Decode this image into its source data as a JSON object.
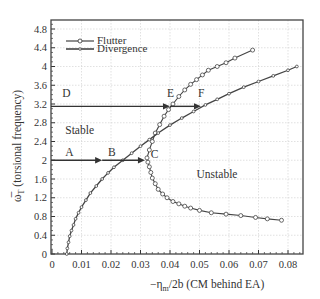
{
  "chart_data": {
    "type": "line",
    "title": "",
    "xlabel": "−ηm/2b (CM behind EA)",
    "ylabel": "ω̅T (torsional frequency)",
    "xlim": [
      0,
      0.085
    ],
    "ylim": [
      0,
      5.0
    ],
    "x_ticks": [
      "0",
      "0.01",
      "0.02",
      "0.03",
      "0.04",
      "0.05",
      "0.06",
      "0.07",
      "0.08"
    ],
    "y_ticks": [
      "0",
      "0.4",
      "0.8",
      "1.2",
      "1.6",
      "2",
      "2.4",
      "2.8",
      "3.2",
      "3.6",
      "4",
      "4.4",
      "4.8"
    ],
    "grid": true,
    "legend_position": "upper left",
    "series": [
      {
        "name": "Flutter",
        "marker": "open-circle",
        "x": [
          0.0778,
          0.073,
          0.069,
          0.064,
          0.059,
          0.054,
          0.05,
          0.047,
          0.045,
          0.043,
          0.041,
          0.039,
          0.0375,
          0.036,
          0.035,
          0.034,
          0.0335,
          0.033,
          0.0325,
          0.0322,
          0.033,
          0.034,
          0.035,
          0.0365,
          0.038,
          0.0395,
          0.041,
          0.043,
          0.045,
          0.047,
          0.049,
          0.051,
          0.053,
          0.056,
          0.059,
          0.062,
          0.068
        ],
        "y": [
          0.72,
          0.75,
          0.78,
          0.82,
          0.85,
          0.88,
          0.93,
          0.98,
          1.02,
          1.07,
          1.12,
          1.2,
          1.28,
          1.38,
          1.5,
          1.62,
          1.74,
          1.86,
          1.96,
          2.05,
          2.22,
          2.4,
          2.58,
          2.76,
          2.94,
          3.08,
          3.2,
          3.36,
          3.5,
          3.62,
          3.72,
          3.82,
          3.92,
          4.0,
          4.08,
          4.18,
          4.35
        ]
      },
      {
        "name": "Divergence",
        "marker": "small-circle",
        "x": [
          0.005,
          0.0052,
          0.0056,
          0.006,
          0.0066,
          0.0073,
          0.008,
          0.009,
          0.01,
          0.0115,
          0.013,
          0.015,
          0.017,
          0.019,
          0.021,
          0.024,
          0.027,
          0.03,
          0.033,
          0.036,
          0.04,
          0.044,
          0.048,
          0.052,
          0.056,
          0.06,
          0.065,
          0.07,
          0.075,
          0.08,
          0.083
        ],
        "y": [
          0.0,
          0.12,
          0.25,
          0.38,
          0.5,
          0.62,
          0.75,
          0.88,
          1.0,
          1.15,
          1.3,
          1.45,
          1.6,
          1.73,
          1.85,
          2.0,
          2.15,
          2.3,
          2.44,
          2.58,
          2.75,
          2.9,
          3.04,
          3.18,
          3.3,
          3.42,
          3.56,
          3.68,
          3.8,
          3.92,
          4.0
        ]
      }
    ],
    "annotations": [
      {
        "text": "A",
        "x": 0.0045,
        "y": 2.1
      },
      {
        "text": "B",
        "x": 0.019,
        "y": 2.1
      },
      {
        "text": "C",
        "x": 0.0335,
        "y": 2.05
      },
      {
        "text": "D",
        "x": 0.0035,
        "y": 3.35
      },
      {
        "text": "E",
        "x": 0.039,
        "y": 3.35
      },
      {
        "text": "F",
        "x": 0.0495,
        "y": 3.35
      },
      {
        "text": "Stable",
        "x": 0.0045,
        "y": 2.55
      },
      {
        "text": "Unstable",
        "x": 0.049,
        "y": 1.62
      }
    ],
    "arrows": [
      {
        "from": [
          0.0,
          2.0
        ],
        "to": [
          0.017,
          2.0
        ]
      },
      {
        "from": [
          0.017,
          2.0
        ],
        "to": [
          0.0315,
          2.0
        ]
      },
      {
        "from": [
          0.0,
          3.15
        ],
        "to": [
          0.04,
          3.15
        ]
      },
      {
        "from": [
          0.04,
          3.15
        ],
        "to": [
          0.0505,
          3.15
        ]
      }
    ]
  },
  "legend": {
    "flutter": "Flutter",
    "divergence": "Divergence"
  },
  "labels": {
    "xlabel_prefix": "−η",
    "xlabel_sub": "m",
    "xlabel_suffix": "/2b (CM behind EA)",
    "ylabel_symbol": "ω̅",
    "ylabel_sub": "T",
    "ylabel_suffix": " (torsional frequency)"
  }
}
